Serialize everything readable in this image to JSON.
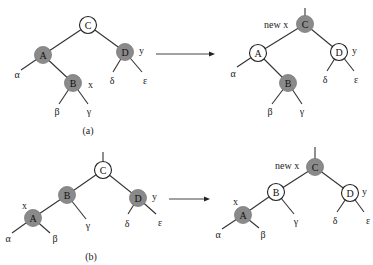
{
  "figure": {
    "colors": {
      "black_node": "#8a8a8a",
      "red_node": "#ffffff",
      "edge": "#333333"
    },
    "panels": [
      {
        "id": "a",
        "caption": "(a)",
        "before": {
          "nodes": [
            {
              "key": "C",
              "label": "C",
              "color": "red"
            },
            {
              "key": "A",
              "label": "A",
              "color": "black"
            },
            {
              "key": "B",
              "label": "B",
              "color": "black",
              "annotation": "x"
            },
            {
              "key": "D",
              "label": "D",
              "color": "black",
              "annotation": "y"
            }
          ],
          "subtrees": [
            "α",
            "β",
            "γ",
            "δ",
            "ε"
          ]
        },
        "after": {
          "nodes": [
            {
              "key": "C",
              "label": "C",
              "color": "black",
              "annotation": "new x"
            },
            {
              "key": "A",
              "label": "A",
              "color": "red"
            },
            {
              "key": "B",
              "label": "B",
              "color": "black"
            },
            {
              "key": "D",
              "label": "D",
              "color": "red",
              "annotation": "y"
            }
          ],
          "subtrees": [
            "α",
            "β",
            "γ",
            "δ",
            "ε"
          ]
        }
      },
      {
        "id": "b",
        "caption": "(b)",
        "before": {
          "nodes": [
            {
              "key": "C",
              "label": "C",
              "color": "red"
            },
            {
              "key": "B",
              "label": "B",
              "color": "black"
            },
            {
              "key": "A",
              "label": "A",
              "color": "black",
              "annotation": "x"
            },
            {
              "key": "D",
              "label": "D",
              "color": "black",
              "annotation": "y"
            }
          ],
          "subtrees": [
            "α",
            "β",
            "γ",
            "δ",
            "ε"
          ]
        },
        "after": {
          "nodes": [
            {
              "key": "C",
              "label": "C",
              "color": "black",
              "annotation": "new x"
            },
            {
              "key": "B",
              "label": "B",
              "color": "red"
            },
            {
              "key": "A",
              "label": "A",
              "color": "black",
              "annotation": "x"
            },
            {
              "key": "D",
              "label": "D",
              "color": "red",
              "annotation": "y"
            }
          ],
          "subtrees": [
            "α",
            "β",
            "γ",
            "δ",
            "ε"
          ]
        }
      }
    ]
  },
  "labels": {
    "C": "C",
    "A": "A",
    "B": "B",
    "D": "D",
    "x": "x",
    "y": "y",
    "new_x": "new x",
    "alpha": "α",
    "beta": "β",
    "gamma": "γ",
    "delta": "δ",
    "epsilon": "ε",
    "caption_a": "(a)",
    "caption_b": "(b)"
  }
}
